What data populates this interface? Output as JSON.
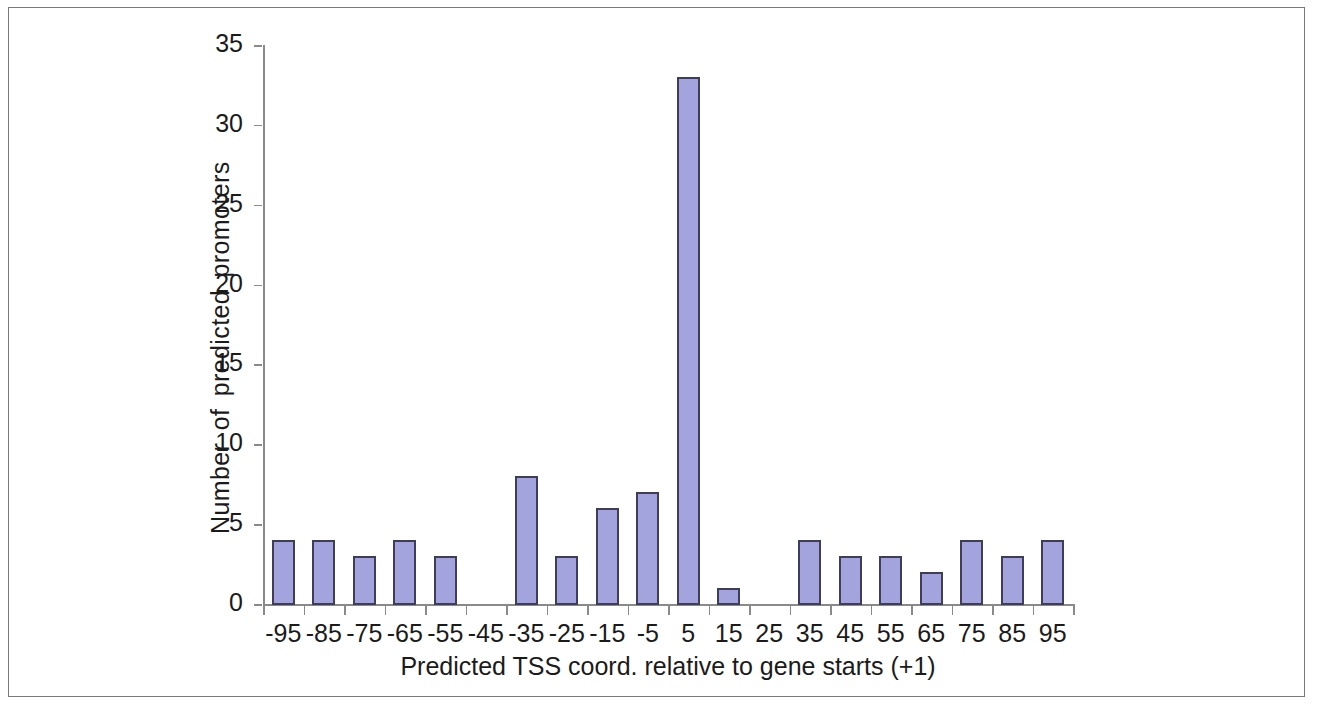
{
  "figure": {
    "frame_color": "#77787b",
    "background": "#ffffff"
  },
  "chart_data": {
    "type": "bar",
    "title": "",
    "subtitle": "",
    "xlabel": "Predicted TSS coord. relative to gene starts (+1)",
    "ylabel": "Number of predicted promoters",
    "categories": [
      "-95",
      "-85",
      "-75",
      "-65",
      "-55",
      "-45",
      "-35",
      "-25",
      "-15",
      "-5",
      "5",
      "15",
      "25",
      "35",
      "45",
      "55",
      "65",
      "75",
      "85",
      "95"
    ],
    "values": [
      4,
      4,
      3,
      4,
      3,
      0,
      8,
      3,
      6,
      7,
      33,
      1,
      0,
      4,
      3,
      3,
      2,
      4,
      3,
      4
    ],
    "ylim": [
      0,
      35
    ],
    "yticks": [
      0,
      5,
      10,
      15,
      20,
      25,
      30,
      35
    ],
    "ytick_labels": [
      "0",
      "5",
      "10",
      "15",
      "20",
      "25",
      "30",
      "35"
    ],
    "grid": false,
    "legend": null,
    "bar_fill_color": "#a3a3dd",
    "bar_border_color": "#3e3e5c",
    "axis_color": "#8a8a8a",
    "text_color": "#1b1b1b"
  }
}
